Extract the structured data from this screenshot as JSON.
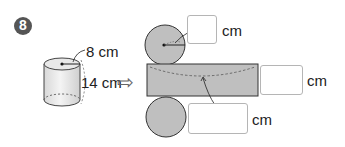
{
  "problem": {
    "number": "8",
    "badge_color": "#555555"
  },
  "cylinder": {
    "radius_label": "8 cm",
    "height_label": "14 cm"
  },
  "arrow": {
    "glyph": "⇨"
  },
  "net": {
    "fill_color": "#bfbfbf",
    "stroke_color": "#333333",
    "answer_boxes": [
      {
        "id": "radius",
        "value": "",
        "unit": "cm"
      },
      {
        "id": "rect-height",
        "value": "",
        "unit": "cm"
      },
      {
        "id": "rect-width",
        "value": "",
        "unit": "cm"
      }
    ]
  }
}
